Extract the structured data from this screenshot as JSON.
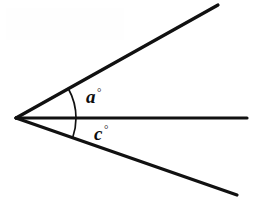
{
  "figure": {
    "kind": "geometry-angle-diagram",
    "background_color": "#ffffff",
    "stroke_color": "#111111",
    "width": 261,
    "height": 212,
    "vertex": {
      "x": 16,
      "y": 118
    },
    "rays": [
      {
        "name": "upper-ray",
        "from": {
          "x": 16,
          "y": 118
        },
        "to": {
          "x": 218,
          "y": 5
        },
        "angle_deg": 29.2
      },
      {
        "name": "middle-ray",
        "from": {
          "x": 16,
          "y": 118
        },
        "to": {
          "x": 247,
          "y": 118
        },
        "angle_deg": 0
      },
      {
        "name": "lower-ray",
        "from": {
          "x": 16,
          "y": 118
        },
        "to": {
          "x": 237,
          "y": 195
        },
        "angle_deg": -19.2
      }
    ],
    "arcs": [
      {
        "name": "arc-a",
        "radius": 60,
        "start_angle_deg": 0,
        "end_angle_deg": 29.2
      },
      {
        "name": "arc-c",
        "radius": 60,
        "start_angle_deg": -19.2,
        "end_angle_deg": 0
      }
    ],
    "labels": [
      {
        "name": "angle-a",
        "variable": "a",
        "unit": "°",
        "x": 86,
        "y": 87
      },
      {
        "name": "angle-c",
        "variable": "c",
        "unit": "°",
        "x": 94,
        "y": 124
      }
    ]
  }
}
